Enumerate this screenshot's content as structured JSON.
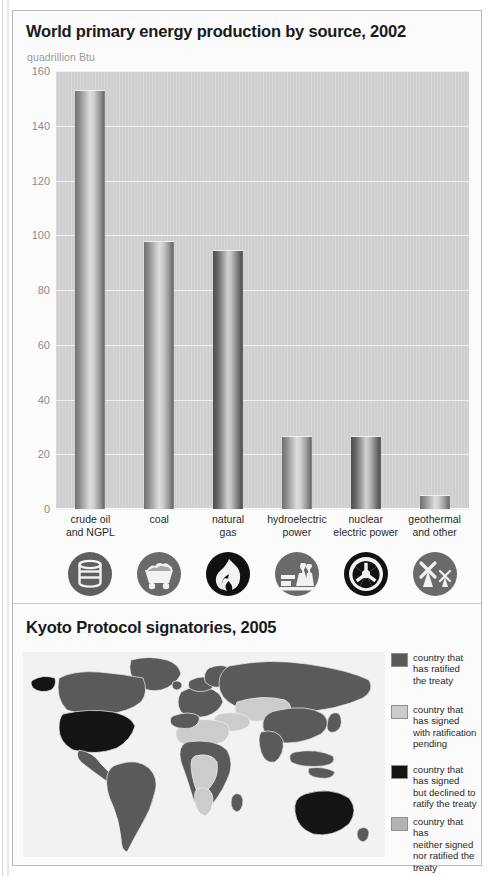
{
  "figure": {
    "top_panel_title": "World primary energy production by source, 2002",
    "unit_label": "quadrillion Btu",
    "bottom_panel_title": "Kyoto Protocol signatories, 2005"
  },
  "chart_data": {
    "type": "bar",
    "title": "World primary energy production by source, 2002",
    "xlabel": "",
    "ylabel": "quadrillion Btu",
    "ylim": [
      0,
      160
    ],
    "yticks": [
      0,
      20,
      40,
      60,
      80,
      100,
      120,
      140,
      160
    ],
    "grid": true,
    "legend": "none",
    "categories": [
      "crude oil and NGPL",
      "coal",
      "natural gas",
      "hydroelectric power",
      "nuclear electric power",
      "geothermal and other"
    ],
    "category_lines": [
      [
        "crude oil",
        "and NGPL"
      ],
      [
        "coal"
      ],
      [
        "natural",
        "gas"
      ],
      [
        "hydroelectric",
        "power"
      ],
      [
        "nuclear",
        "electric power"
      ],
      [
        "geothermal",
        "and other"
      ]
    ],
    "values": [
      153,
      98,
      94.5,
      26.5,
      26.5,
      5
    ],
    "icons": [
      "oil-barrel-icon",
      "coal-cart-icon",
      "flame-icon",
      "power-plant-icon",
      "radiation-icon",
      "windmill-icon"
    ]
  },
  "map": {
    "title": "Kyoto Protocol signatories, 2005",
    "legend": [
      {
        "color": "#5a5a5a",
        "lines": [
          "country that",
          "has ratified",
          "the treaty"
        ],
        "label": "country that has ratified the treaty"
      },
      {
        "color": "#cccccc",
        "lines": [
          "country that",
          "has signed",
          "with ratification",
          "pending"
        ],
        "label": "country that has signed with ratification pending"
      },
      {
        "color": "#141414",
        "lines": [
          "country that",
          "has signed",
          "but declined to",
          "ratify the treaty"
        ],
        "label": "country that has signed but declined to ratify the treaty"
      },
      {
        "color": "#b4b4b4",
        "lines": [
          "country that has",
          "neither signed",
          "nor ratified the",
          "treaty"
        ],
        "label": "country that has neither signed nor ratified the treaty"
      }
    ]
  },
  "colors": {
    "panel_background": "#fbfbfb",
    "plot_background": "#cfcfcf",
    "gridline": "#f0f0f0",
    "bar_mid": "#dedede",
    "bar_dark": "#6f6f6f",
    "text": "#231f20",
    "tick_text": "#8c8c8c",
    "map_land_ratified": "#5a5a5a",
    "map_land_declined": "#141414",
    "map_land_pending": "#cccccc",
    "map_ocean": "#f2f2f2"
  }
}
